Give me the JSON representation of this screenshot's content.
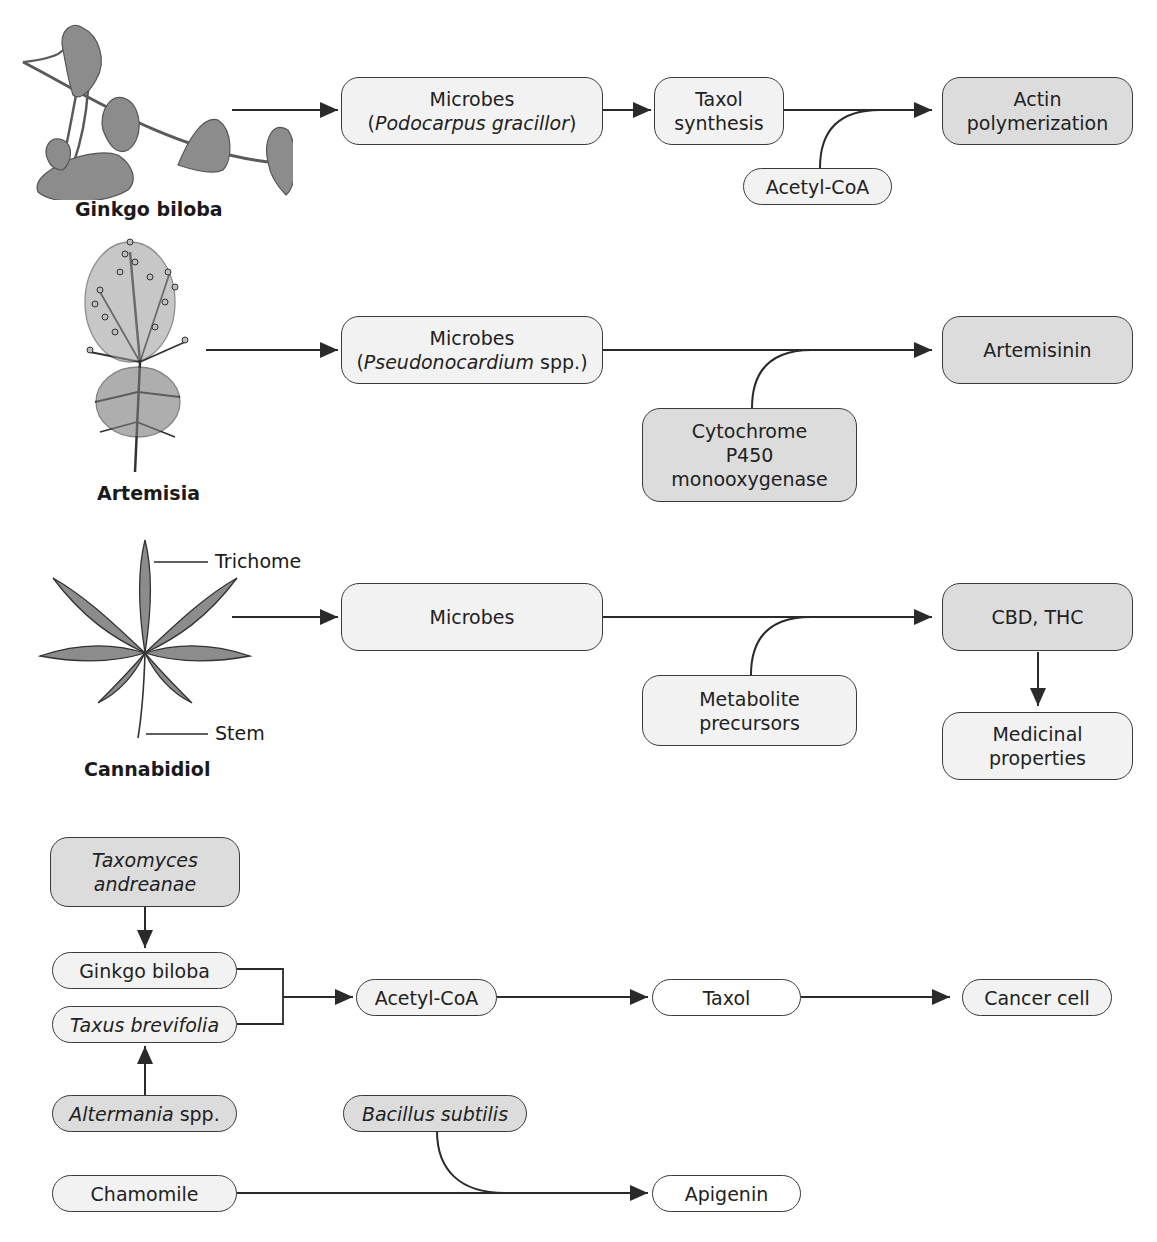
{
  "rows": {
    "ginkgo": {
      "plant_label": "Ginkgo biloba",
      "source": {
        "line1": "Microbes",
        "line2_prefix": "(",
        "line2_italic": "Podocarpus gracillor",
        "line2_suffix": ")"
      },
      "step": {
        "line1": "Taxol",
        "line2": "synthesis"
      },
      "cofactor": "Acetyl-CoA",
      "product": {
        "line1": "Actin",
        "line2": "polymerization"
      }
    },
    "artemisia": {
      "plant_label": "Artemisia",
      "source": {
        "line1": "Microbes",
        "line2_prefix": "(",
        "line2_italic": "Pseudonocardium",
        "line2_suffix": " spp.)"
      },
      "cofactor": {
        "line1": "Cytochrome",
        "line2": "P450",
        "line3": "monooxygenase"
      },
      "product": "Artemisinin"
    },
    "cannabidiol": {
      "plant_label": "Cannabidiol",
      "callouts": {
        "top": "Trichome",
        "bottom": "Stem"
      },
      "source": "Microbes",
      "cofactor": {
        "line1": "Metabolite",
        "line2": "precursors"
      },
      "product": "CBD, THC",
      "outcome": {
        "line1": "Medicinal",
        "line2": "properties"
      }
    }
  },
  "lower_flow": {
    "endophyte_top": {
      "line1": "Taxomyces",
      "line2": "andreanae"
    },
    "host1": "Ginkgo biloba",
    "host2": "Taxus brevifolia",
    "endophyte_bottom": {
      "italic": "Altermania",
      "suffix": " spp."
    },
    "intermediate": "Acetyl-CoA",
    "compound": "Taxol",
    "target": "Cancer cell",
    "bacterium": "Bacillus subtilis",
    "plant": "Chamomile",
    "flavonoid": "Apigenin"
  },
  "colors": {
    "stroke": "#2a2a2a",
    "fill_white": "#ffffff",
    "fill_light": "#f2f2f2",
    "fill_mid": "#dcdcdc",
    "plant_fill": "#8c8c8c"
  }
}
